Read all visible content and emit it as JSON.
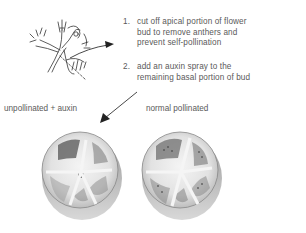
{
  "diagram": {
    "steps": [
      {
        "number": "1.",
        "lines": [
          "cut off apical portion of flower",
          "bud to remove anthers and",
          "prevent self-pollination"
        ]
      },
      {
        "number": "2.",
        "lines": [
          "add an auxin spray to the",
          "remaining basal portion of bud"
        ]
      }
    ],
    "labels": {
      "left_fruit": "unpollinated + auxin",
      "right_fruit": "normal pollinated"
    },
    "illustrations": {
      "flower": "flower-bud-drawing",
      "fruit_left": "tomato-cross-section-unpollinated",
      "fruit_right": "tomato-cross-section-pollinated"
    },
    "colors": {
      "ink": "#333333",
      "text": "#5a5a5a",
      "fruit_shadow": "#6e6e6e",
      "fruit_flesh": "#e6e6e6"
    }
  }
}
